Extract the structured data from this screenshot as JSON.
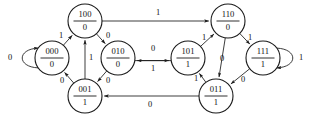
{
  "diagram": {
    "type": "state-transition-diagram",
    "title": "",
    "canvas": {
      "width": 311,
      "height": 118
    },
    "stroke_color": "#1a1a1a",
    "text_color": "#111111",
    "background_color": "#ffffff",
    "node_radius": 17,
    "node_label_format": "state / output",
    "states": [
      {
        "id": "100",
        "state": "100",
        "output": "0",
        "cx": 85,
        "cy": 21
      },
      {
        "id": "110",
        "state": "110",
        "output": "0",
        "cx": 228,
        "cy": 21
      },
      {
        "id": "000",
        "state": "000",
        "output": "0",
        "cx": 52,
        "cy": 58
      },
      {
        "id": "010",
        "state": "010",
        "output": "0",
        "cx": 118,
        "cy": 58
      },
      {
        "id": "101",
        "state": "101",
        "output": "1",
        "cx": 188,
        "cy": 58
      },
      {
        "id": "111",
        "state": "111",
        "output": "1",
        "cx": 263,
        "cy": 58
      },
      {
        "id": "001",
        "state": "001",
        "output": "1",
        "cx": 85,
        "cy": 96
      },
      {
        "id": "011",
        "state": "011",
        "output": "1",
        "cx": 216,
        "cy": 96
      }
    ],
    "transitions": [
      {
        "from": "000",
        "to": "000",
        "input": "0",
        "label_x": 10,
        "label_y": 58
      },
      {
        "from": "000",
        "to": "100",
        "input": "1",
        "label_x": 61,
        "label_y": 36
      },
      {
        "from": "001",
        "to": "000",
        "input": "0",
        "label_x": 62,
        "label_y": 81
      },
      {
        "from": "100",
        "to": "110",
        "input": "1",
        "label_x": 158,
        "label_y": 13
      },
      {
        "from": "100",
        "to": "010",
        "input": "0",
        "label_x": 108,
        "label_y": 36
      },
      {
        "from": "001",
        "to": "100",
        "input": "1",
        "label_x": 91,
        "label_y": 58
      },
      {
        "from": "010",
        "to": "001",
        "input": "0",
        "label_x": 108,
        "label_y": 81
      },
      {
        "from": "101",
        "to": "010",
        "input": "0",
        "label_x": 153,
        "label_y": 49
      },
      {
        "from": "010",
        "to": "101",
        "input": "1",
        "label_x": 153,
        "label_y": 69
      },
      {
        "from": "101",
        "to": "110",
        "input": "1",
        "label_x": 204,
        "label_y": 38
      },
      {
        "from": "110",
        "to": "111",
        "input": "1",
        "label_x": 250,
        "label_y": 38
      },
      {
        "from": "110",
        "to": "011",
        "input": "0",
        "label_x": 222,
        "label_y": 59
      },
      {
        "from": "011",
        "to": "101",
        "input": "1",
        "label_x": 196,
        "label_y": 79
      },
      {
        "from": "111",
        "to": "011",
        "input": "0",
        "label_x": 243,
        "label_y": 80
      },
      {
        "from": "111",
        "to": "111",
        "input": "1",
        "label_x": 301,
        "label_y": 58
      },
      {
        "from": "011",
        "to": "001",
        "input": "0",
        "label_x": 150,
        "label_y": 105
      }
    ]
  }
}
